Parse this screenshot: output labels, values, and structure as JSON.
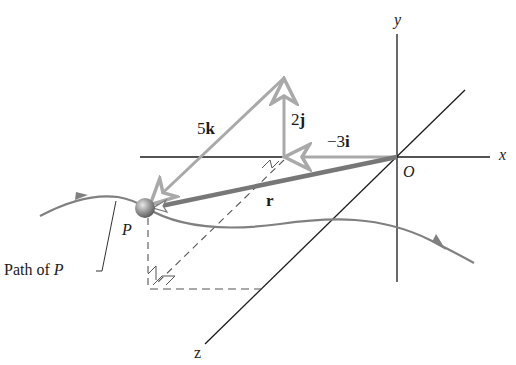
{
  "figure": {
    "axes": {
      "x_label": "x",
      "y_label": "y",
      "z_label": "z",
      "origin_label": "O"
    },
    "vectors": {
      "r_label": "r",
      "k_component_label": "5k",
      "k_coeff": "5",
      "k_unit": "k",
      "j_component_label": "2j",
      "j_coeff": "2",
      "j_unit": "j",
      "i_component_label": "−3i",
      "i_coeff": "−3",
      "i_unit": "i"
    },
    "particle": {
      "label": "P",
      "path_label_prefix": "Path of ",
      "path_label_var": "P"
    },
    "colors": {
      "axis": "#1a1a1a",
      "component_vector": "#a9a9a9",
      "r_vector": "#777777",
      "path": "#808080",
      "dashed": "#555555"
    }
  }
}
